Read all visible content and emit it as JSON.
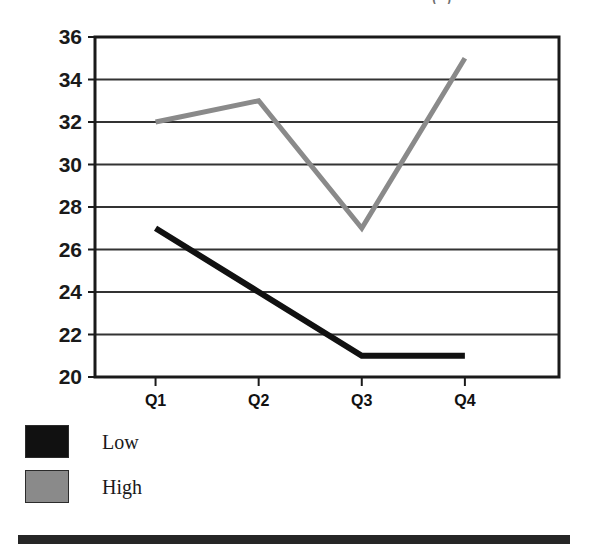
{
  "figure": {
    "title_fragment": "(          )",
    "bottom_rule_color": "#262626"
  },
  "chart_data": {
    "type": "line",
    "title": "",
    "xlabel": "",
    "ylabel": "",
    "categories": [
      "Q1",
      "Q2",
      "Q3",
      "Q4"
    ],
    "series": [
      {
        "name": "Low",
        "values": [
          27,
          24,
          21,
          21
        ],
        "color": "#111111",
        "line_width": 6
      },
      {
        "name": "High",
        "values": [
          32,
          33,
          27,
          35
        ],
        "color": "#8a8a8a",
        "line_width": 5
      }
    ],
    "ylim": [
      20,
      36
    ],
    "yticks": [
      20,
      22,
      24,
      26,
      28,
      30,
      32,
      34,
      36
    ],
    "ytick_labels": [
      "20",
      "22",
      "24",
      "26",
      "28",
      "30",
      "32",
      "34",
      "36"
    ],
    "xtick_labels": [
      "Q1",
      "Q2",
      "Q3",
      "Q4"
    ],
    "grid": true,
    "grid_axis": "y",
    "grid_color": "#333333",
    "frame_color": "#1a1a1a",
    "legend_position": "below-left",
    "legend_entries": [
      {
        "label": "Low",
        "color": "#111111"
      },
      {
        "label": "High",
        "color": "#8a8a8a"
      }
    ]
  }
}
